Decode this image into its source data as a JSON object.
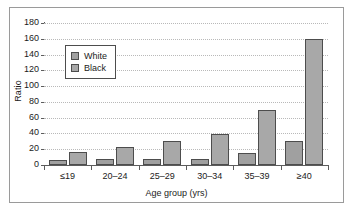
{
  "chart_data": {
    "type": "bar",
    "title": "",
    "xlabel": "Age group (yrs)",
    "ylabel": "Ratio",
    "categories": [
      "≤19",
      "20–24",
      "25–29",
      "30–34",
      "35–39",
      "≥40"
    ],
    "series": [
      {
        "name": "White",
        "values": [
          6,
          7,
          7,
          8,
          15,
          30
        ],
        "color": "#a0a0a0"
      },
      {
        "name": "Black",
        "values": [
          17,
          23,
          31,
          39,
          70,
          160
        ],
        "color": "#a8a8a8"
      }
    ],
    "ylim": [
      0,
      180
    ],
    "ytick_labels": [
      "180",
      "160",
      "140",
      "120",
      "100",
      "80",
      "60",
      "40",
      "20",
      "0"
    ],
    "ytick_values": [
      180,
      160,
      140,
      120,
      100,
      80,
      60,
      40,
      20,
      0
    ],
    "grid": "horizontal-dotted",
    "legend_position": "upper-left",
    "legend": [
      {
        "label": "White",
        "swatch": "white-series"
      },
      {
        "label": "Black",
        "swatch": "black-series"
      }
    ]
  }
}
